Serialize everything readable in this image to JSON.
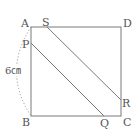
{
  "diagram": {
    "type": "geometry-square",
    "colors": {
      "line": "#7a7a7a",
      "arc": "#9a9a9a",
      "text": "#555555",
      "background": "#ffffff"
    },
    "square": {
      "label": "ABCD",
      "side_label": "6㎝"
    },
    "points": {
      "A": {
        "label": "A",
        "x": 31,
        "y": 27
      },
      "B": {
        "label": "B",
        "x": 31,
        "y": 116
      },
      "C": {
        "label": "C",
        "x": 121,
        "y": 116
      },
      "D": {
        "label": "D",
        "x": 121,
        "y": 27
      },
      "P": {
        "label": "P",
        "x": 31,
        "y": 43
      },
      "Q": {
        "label": "Q",
        "x": 104,
        "y": 116
      },
      "R": {
        "label": "R",
        "x": 121,
        "y": 100
      },
      "S": {
        "label": "S",
        "x": 47,
        "y": 27
      }
    },
    "segments": [
      {
        "from": "P",
        "to": "Q"
      },
      {
        "from": "S",
        "to": "R"
      }
    ]
  }
}
